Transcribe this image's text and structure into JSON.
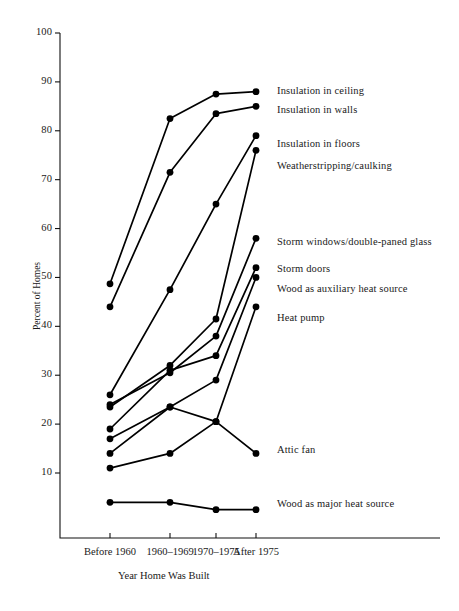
{
  "chart_data": {
    "type": "line",
    "title": "",
    "xlabel": "Year Home Was Built",
    "ylabel": "Percent of Homes",
    "categories": [
      "Before 1960",
      "1960–1969",
      "1970–1975",
      "After 1975"
    ],
    "ylim": [
      0,
      100
    ],
    "yticks": [
      10,
      20,
      30,
      40,
      50,
      60,
      70,
      80,
      90,
      100
    ],
    "ytick_labels": [
      "10",
      "20",
      "30",
      "40",
      "50",
      "60",
      "70",
      "80",
      "90",
      "100"
    ],
    "grid": false,
    "legend_position": "right-inline",
    "marker": "filled-circle",
    "line_color": "#000000",
    "series": [
      {
        "name": "Insulation in ceiling",
        "values": [
          48.7,
          82.5,
          87.5,
          88.0
        ]
      },
      {
        "name": "Insulation in walls",
        "values": [
          44.0,
          71.5,
          83.5,
          85.0
        ]
      },
      {
        "name": "Insulation in floors",
        "values": [
          26.0,
          47.5,
          65.0,
          79.0
        ]
      },
      {
        "name": "Weatherstripping/caulking",
        "values": [
          23.5,
          32.0,
          41.5,
          76.0
        ]
      },
      {
        "name": "Storm windows/double-paned glass",
        "values": [
          24.0,
          30.5,
          38.0,
          58.0
        ]
      },
      {
        "name": "Storm doors",
        "values": [
          19.0,
          31.0,
          34.0,
          52.0
        ]
      },
      {
        "name": "Wood as auxiliary heat source",
        "values": [
          17.0,
          23.5,
          29.0,
          50.0
        ]
      },
      {
        "name": "Heat pump",
        "values": [
          14.0,
          23.5,
          20.5,
          44.0
        ]
      },
      {
        "name": "Attic fan",
        "values": [
          11.0,
          14.0,
          20.5,
          14.0
        ]
      },
      {
        "name": "Wood as major heat source",
        "values": [
          4.0,
          4.0,
          2.5,
          2.5
        ]
      }
    ],
    "annotations": [
      {
        "text": "Insulation in ceiling",
        "y_pct": 88.0
      },
      {
        "text": "Insulation in walls",
        "y_pct": 84.0
      },
      {
        "text": "Insulation in floors",
        "y_pct": 77.0
      },
      {
        "text": "Weatherstripping/caulking",
        "y_pct": 72.5
      },
      {
        "text": "Storm windows/double-paned glass",
        "y_pct": 57.0
      },
      {
        "text": "Storm doors",
        "y_pct": 51.5
      },
      {
        "text": "Wood as auxiliary heat source",
        "y_pct": 47.5
      },
      {
        "text": "Heat pump",
        "y_pct": 41.5
      },
      {
        "text": "Attic fan",
        "y_pct": 14.5
      },
      {
        "text": "Wood as major heat source",
        "y_pct": 3.5
      }
    ]
  }
}
